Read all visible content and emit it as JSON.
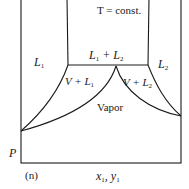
{
  "figure": {
    "panel_label": "(n)",
    "condition": "T = const.",
    "axes": {
      "x_label": "x1, y1",
      "y_label": "P"
    },
    "regions": {
      "liquid1": "L1",
      "liquid2": "L2",
      "liquid1_liquid2": "L1 + L2",
      "vapor_liquid1": "V + L1",
      "vapor_liquid2": "V + L2",
      "vapor": "Vapor"
    },
    "line_color": "#1a1a1a"
  }
}
